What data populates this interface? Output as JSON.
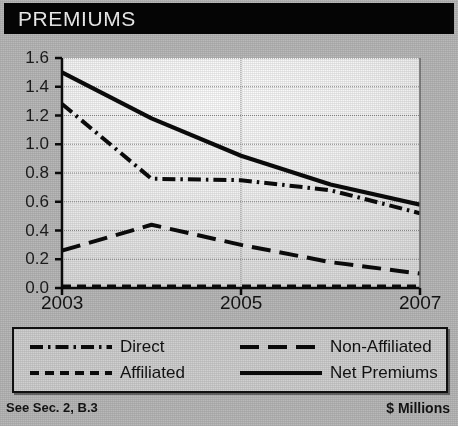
{
  "banner": {
    "title": "PREMIUMS"
  },
  "footer": {
    "left": "See Sec. 2, B.3",
    "right": "$ Millions"
  },
  "legend": {
    "items": [
      {
        "label": "Direct",
        "style": "dashdot"
      },
      {
        "label": "Non-Affiliated",
        "style": "longdash"
      },
      {
        "label": "Affiliated",
        "style": "shortdash"
      },
      {
        "label": "Net Premiums",
        "style": "solid"
      }
    ]
  },
  "chart_data": {
    "type": "line",
    "title": "PREMIUMS",
    "xlabel": "",
    "ylabel": "",
    "unit": "$ Millions",
    "grid": true,
    "legend_position": "bottom",
    "x": [
      2003,
      2004,
      2005,
      2006,
      2007
    ],
    "xlim": [
      2003,
      2007
    ],
    "ylim": [
      0.0,
      1.6
    ],
    "xticks": [
      2003,
      2005,
      2007
    ],
    "xtick_labels": [
      "2003",
      "2005",
      "2007"
    ],
    "yticks": [
      0.0,
      0.2,
      0.4,
      0.6,
      0.8,
      1.0,
      1.2,
      1.4,
      1.6
    ],
    "ytick_labels": [
      "0.0",
      "0.2",
      "0.4",
      "0.6",
      "0.8",
      "1.0",
      "1.2",
      "1.4",
      "1.6"
    ],
    "series": [
      {
        "name": "Direct",
        "style": "dashdot",
        "values": [
          1.28,
          0.76,
          0.75,
          0.68,
          0.52
        ]
      },
      {
        "name": "Affiliated",
        "style": "shortdash",
        "values": [
          0.01,
          0.01,
          0.01,
          0.01,
          0.01
        ]
      },
      {
        "name": "Non-Affiliated",
        "style": "longdash",
        "values": [
          0.26,
          0.44,
          0.3,
          0.18,
          0.1
        ]
      },
      {
        "name": "Net Premiums",
        "style": "solid",
        "values": [
          1.5,
          1.18,
          0.92,
          0.72,
          0.58
        ]
      }
    ]
  }
}
